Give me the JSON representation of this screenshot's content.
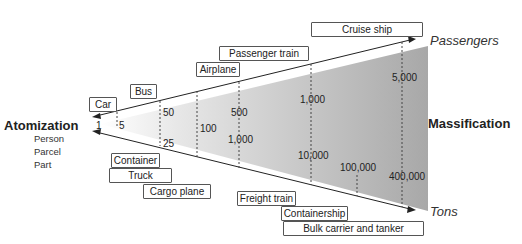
{
  "left_title": "Atomization",
  "left_sub": [
    "Person",
    "Parcel",
    "Part"
  ],
  "right_title": "Massification",
  "top_axis_label": "Passengers",
  "bottom_axis_label": "Tons",
  "origin": "1",
  "top_values": [
    "5",
    "50",
    "500",
    "1,000",
    "5,000"
  ],
  "bottom_values": [
    "25",
    "100",
    "1,000",
    "10,000",
    "100,000",
    "400,000"
  ],
  "passenger_modes": [
    "Car",
    "Bus",
    "Airplane",
    "Passenger train",
    "Cruise ship"
  ],
  "freight_modes": [
    "Container",
    "Truck",
    "Cargo plane",
    "Freight train",
    "Containership",
    "Bulk carrier and tanker"
  ],
  "colors": {
    "fill_light": "#f4f4f4",
    "fill_dark": "#a9a9a9",
    "line": "#222222"
  }
}
